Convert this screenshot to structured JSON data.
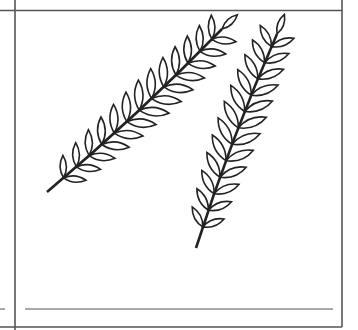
{
  "figure": {
    "branches": [
      {
        "name": "upper-left-branch",
        "stem_start": [
          222,
          29
        ],
        "stem_end": [
          47,
          192
        ],
        "leaflet_pairs": 13
      },
      {
        "name": "lower-right-branch",
        "stem_start": [
          277,
          34
        ],
        "stem_end": [
          196,
          248
        ],
        "leaflet_pairs": 12
      }
    ],
    "colors": {
      "line": "#222222",
      "frame": "#555555",
      "background": "#ffffff"
    }
  }
}
